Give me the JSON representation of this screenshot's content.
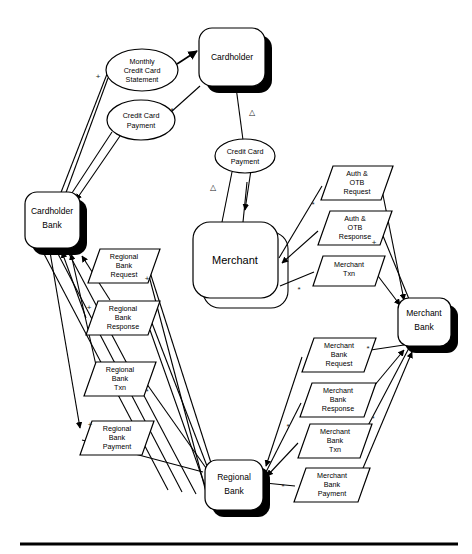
{
  "diagram": {
    "type": "data-flow-diagram",
    "colors": {
      "stroke": "#000000",
      "fill": "#ffffff",
      "shadow": "#000000"
    },
    "processes": [
      {
        "id": "cardholder",
        "label": "Cardholder",
        "x": 199,
        "y": 28,
        "w": 66,
        "h": 58
      },
      {
        "id": "cardholder-bank",
        "label_line1": "Cardholder",
        "label_line2": "Bank",
        "x": 25,
        "y": 192,
        "w": 55,
        "h": 56
      },
      {
        "id": "merchant",
        "label": "Merchant",
        "x": 193,
        "y": 222,
        "w": 85,
        "h": 76
      },
      {
        "id": "merchant-bank",
        "label_line1": "Merchant",
        "label_line2": "Bank",
        "x": 398,
        "y": 298,
        "w": 53,
        "h": 48
      },
      {
        "id": "regional-bank",
        "label_line1": "Regional",
        "label_line2": "Bank",
        "x": 205,
        "y": 460,
        "w": 58,
        "h": 50
      }
    ],
    "data_stores": [
      {
        "id": "monthly-credit-card-statement",
        "lines": [
          "Monthly",
          "Credit Card",
          "Statement"
        ],
        "cx": 142,
        "cy": 70,
        "rx": 36,
        "ry": 21
      },
      {
        "id": "credit-card-payment-left",
        "lines": [
          "Credit Card",
          "Payment"
        ],
        "cx": 141,
        "cy": 120,
        "rx": 34,
        "ry": 20
      },
      {
        "id": "credit-card-payment-mid",
        "lines": [
          "Credit Card",
          "Payment"
        ],
        "cx": 245,
        "cy": 156,
        "rx": 30,
        "ry": 17
      }
    ],
    "flows_left": [
      {
        "id": "regional-bank-request",
        "lines": [
          "Regional",
          "Bank",
          "Request"
        ],
        "x": 88,
        "y": 249,
        "w": 60,
        "h": 34
      },
      {
        "id": "regional-bank-response",
        "lines": [
          "Regional",
          "Bank",
          "Response"
        ],
        "x": 86,
        "y": 301,
        "w": 62,
        "h": 34
      },
      {
        "id": "regional-bank-txn",
        "lines": [
          "Regional",
          "Bank",
          "Txn"
        ],
        "x": 84,
        "y": 362,
        "w": 60,
        "h": 34
      },
      {
        "id": "regional-bank-payment",
        "lines": [
          "Regional",
          "Bank",
          "Payment"
        ],
        "x": 80,
        "y": 421,
        "w": 62,
        "h": 34
      }
    ],
    "flows_right_upper": [
      {
        "id": "auth-otb-request",
        "lines": [
          "Auth &",
          "OTB",
          "Request"
        ],
        "x": 321,
        "y": 166,
        "w": 60,
        "h": 34
      },
      {
        "id": "auth-otb-response",
        "lines": [
          "Auth &",
          "OTB",
          "Response"
        ],
        "x": 318,
        "y": 211,
        "w": 62,
        "h": 34
      },
      {
        "id": "merchant-txn",
        "lines": [
          "Merchant",
          "Txn"
        ],
        "x": 313,
        "y": 256,
        "w": 62,
        "h": 30
      }
    ],
    "flows_right_lower": [
      {
        "id": "merchant-bank-request",
        "lines": [
          "Merchant",
          "Bank",
          "Request"
        ],
        "x": 302,
        "y": 338,
        "w": 62,
        "h": 34
      },
      {
        "id": "merchant-bank-response",
        "lines": [
          "Merchant",
          "Bank",
          "Response"
        ],
        "x": 300,
        "y": 383,
        "w": 64,
        "h": 34
      },
      {
        "id": "merchant-bank-txn",
        "lines": [
          "Merchant",
          "Bank",
          "Txn"
        ],
        "x": 298,
        "y": 424,
        "w": 62,
        "h": 34
      },
      {
        "id": "merchant-bank-payment",
        "lines": [
          "Merchant",
          "Bank",
          "Payment"
        ],
        "x": 294,
        "y": 468,
        "w": 64,
        "h": 34
      }
    ],
    "markers": [
      {
        "id": "plus-1",
        "glyph": "+",
        "x": 98,
        "y": 77
      },
      {
        "id": "star-1",
        "glyph": "*",
        "x": 172,
        "y": 111
      },
      {
        "id": "delta-1",
        "glyph": "△",
        "x": 252,
        "y": 113
      },
      {
        "id": "delta-2",
        "glyph": "△",
        "x": 213,
        "y": 188
      },
      {
        "id": "star-2",
        "glyph": "*",
        "x": 313,
        "y": 205
      },
      {
        "id": "plus-2",
        "glyph": "+",
        "x": 374,
        "y": 243
      },
      {
        "id": "star-3",
        "glyph": "*",
        "x": 299,
        "y": 290
      },
      {
        "id": "plus-3",
        "glyph": "+",
        "x": 147,
        "y": 279
      },
      {
        "id": "plus-4",
        "glyph": "+",
        "x": 89,
        "y": 314
      },
      {
        "id": "star-4",
        "glyph": "*",
        "x": 147,
        "y": 398
      },
      {
        "id": "plus-5",
        "glyph": "+",
        "x": 90,
        "y": 425
      },
      {
        "id": "star-5",
        "glyph": "*",
        "x": 366,
        "y": 353
      },
      {
        "id": "star-6",
        "glyph": "*",
        "x": 371,
        "y": 423
      },
      {
        "id": "star-7",
        "glyph": "*",
        "x": 281,
        "y": 489
      },
      {
        "id": "star-8",
        "glyph": "*",
        "x": 286,
        "y": 427
      }
    ],
    "base_rule": {
      "x1": 20,
      "x2": 458,
      "y": 544
    }
  }
}
